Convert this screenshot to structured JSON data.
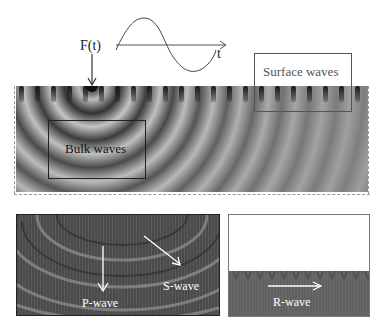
{
  "figure": {
    "force_label": "F(t)",
    "time_axis_label": "t",
    "signal": "sine wave (one period)",
    "main_panel": {
      "description": "wave field simulation with point source at surface",
      "regions": [
        {
          "label": "Bulk waves"
        },
        {
          "label": "Surface waves"
        }
      ]
    },
    "bottom_left_panel": {
      "arrows": [
        {
          "label": "P-wave",
          "direction": "down"
        },
        {
          "label": "S-wave",
          "direction": "down-right"
        }
      ]
    },
    "bottom_right_panel": {
      "arrows": [
        {
          "label": "R-wave",
          "direction": "right"
        }
      ]
    }
  }
}
